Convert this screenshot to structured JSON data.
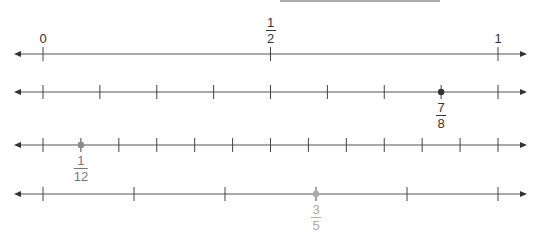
{
  "top_rule": {
    "x1": 280,
    "x2": 440,
    "y": 1,
    "color": "#aaaaaa"
  },
  "axis": {
    "left_arrow_x": 14,
    "right_arrow_x": 527,
    "start_x": 43,
    "end_x": 498,
    "color": "#555555"
  },
  "number_lines": [
    {
      "name": "halves",
      "y": 54,
      "divisions": 2,
      "labels": [
        {
          "pos": 0,
          "text": "0",
          "type": "whole"
        },
        {
          "pos": 1,
          "num": "1",
          "den": "2",
          "type": "fraction"
        },
        {
          "pos": 2,
          "text": "1",
          "type": "whole"
        }
      ]
    },
    {
      "name": "eighths",
      "y": 92,
      "divisions": 8,
      "point": {
        "pos": 7,
        "num": "7",
        "den": "8",
        "color": "#333333",
        "label_color": "#333333"
      }
    },
    {
      "name": "twelfths",
      "y": 145,
      "divisions": 12,
      "point": {
        "pos": 1,
        "num": "1",
        "den": "12",
        "color": "#888888",
        "label_color": "#777777"
      }
    },
    {
      "name": "fifths",
      "y": 194,
      "divisions": 5,
      "point": {
        "pos": 3,
        "num": "3",
        "den": "5",
        "color": "#aaaaaa",
        "label_color": "#aaaaaa"
      }
    }
  ]
}
